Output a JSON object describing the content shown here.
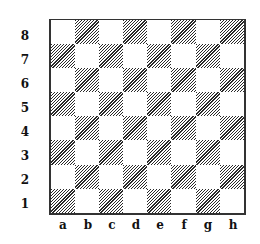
{
  "diagram": {
    "type": "chessboard",
    "ranks": [
      "8",
      "7",
      "6",
      "5",
      "4",
      "3",
      "2",
      "1"
    ],
    "files": [
      "a",
      "b",
      "c",
      "d",
      "e",
      "f",
      "g",
      "h"
    ],
    "square_colors": {
      "light": "#ffffff",
      "dark_hatch": "#2a2a2a"
    },
    "bottom_left_square": "dark"
  }
}
